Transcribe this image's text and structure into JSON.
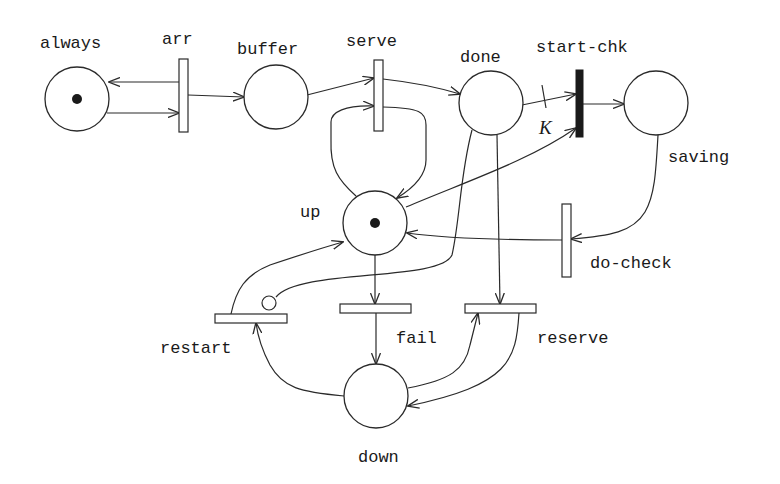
{
  "diagram": {
    "type": "petri-net",
    "places": [
      {
        "id": "always",
        "label": "always",
        "cx": 77,
        "cy": 99,
        "r": 32,
        "tokens": 1,
        "label_x": 40,
        "label_y": 48
      },
      {
        "id": "buffer",
        "label": "buffer",
        "cx": 276,
        "cy": 97,
        "r": 32,
        "tokens": 0,
        "label_x": 237,
        "label_y": 54
      },
      {
        "id": "done",
        "label": "done",
        "cx": 491,
        "cy": 103,
        "r": 32,
        "tokens": 0,
        "label_x": 460,
        "label_y": 62
      },
      {
        "id": "saving",
        "label": "saving",
        "cx": 656,
        "cy": 103,
        "r": 32,
        "tokens": 0,
        "label_x": 668,
        "label_y": 162
      },
      {
        "id": "up",
        "label": "up",
        "cx": 375,
        "cy": 223,
        "r": 32,
        "tokens": 1,
        "label_x": 300,
        "label_y": 217
      },
      {
        "id": "down",
        "label": "down",
        "cx": 376,
        "cy": 396,
        "r": 32,
        "tokens": 0,
        "label_x": 358,
        "label_y": 462
      }
    ],
    "transitions": [
      {
        "id": "arr",
        "label": "arr",
        "kind": "timed",
        "x": 179,
        "y": 59,
        "w": 9,
        "h": 73,
        "label_x": 162,
        "label_y": 44
      },
      {
        "id": "serve",
        "label": "serve",
        "kind": "timed",
        "x": 374,
        "y": 60,
        "w": 9,
        "h": 71,
        "label_x": 346,
        "label_y": 46
      },
      {
        "id": "start-chk",
        "label": "start-chk",
        "kind": "immediate",
        "x": 576,
        "y": 70,
        "w": 7,
        "h": 67,
        "label_x": 536,
        "label_y": 52
      },
      {
        "id": "do-check",
        "label": "do-check",
        "kind": "timed",
        "x": 562,
        "y": 204,
        "w": 9,
        "h": 73,
        "label_x": 590,
        "label_y": 268
      },
      {
        "id": "restart",
        "label": "restart",
        "kind": "timed",
        "x": 215,
        "y": 314,
        "w": 72,
        "h": 9,
        "label_x": 160,
        "label_y": 353
      },
      {
        "id": "fail",
        "label": "fail",
        "kind": "timed",
        "x": 340,
        "y": 304,
        "w": 71,
        "h": 9,
        "label_x": 396,
        "label_y": 343
      },
      {
        "id": "reserve",
        "label": "reserve",
        "kind": "timed",
        "x": 465,
        "y": 304,
        "w": 71,
        "h": 9,
        "label_x": 537,
        "label_y": 343
      }
    ],
    "arcs": [
      {
        "from": "arr",
        "to": "always",
        "d": "M179,82 L109,82",
        "arrow": "end"
      },
      {
        "from": "always",
        "to": "arr",
        "d": "M107,113 L179,113",
        "arrow": "end"
      },
      {
        "from": "arr",
        "to": "buffer",
        "d": "M188,95 L244,97",
        "arrow": "end"
      },
      {
        "from": "buffer",
        "to": "serve",
        "d": "M307,95 L374,78",
        "arrow": "end"
      },
      {
        "from": "serve",
        "to": "done",
        "d": "M383,79 C410,82 440,88 460,94",
        "arrow": "end"
      },
      {
        "from": "up",
        "to": "serve",
        "d": "M356,196 C338,180 330,168 331,140 L331,122 C331,112 345,105 374,106",
        "arrow": "end"
      },
      {
        "from": "serve",
        "to": "up",
        "d": "M383,107 C420,108 426,112 426,125 L426,160 C426,175 415,187 397,198",
        "arrow": "end"
      },
      {
        "from": "done",
        "to": "start-chk",
        "d": "M522,105 L576,94",
        "arrow": "end",
        "multiplicity": "K",
        "k_x": 539,
        "k_y": 134,
        "tick": "M542,85 L546,108"
      },
      {
        "from": "done",
        "to": "reserve",
        "d": "M497,135 L500,304",
        "arrow": "end"
      },
      {
        "from": "start-chk",
        "to": "saving",
        "d": "M583,104 L624,104",
        "arrow": "end"
      },
      {
        "from": "up",
        "to": "start-chk",
        "d": "M406,207 C470,180 530,160 576,128",
        "arrow": "end"
      },
      {
        "from": "saving",
        "to": "do-check",
        "d": "M658,135 C656,170 655,195 645,212 C633,232 610,236 571,239",
        "arrow": "end"
      },
      {
        "from": "do-check",
        "to": "up",
        "d": "M562,240 C500,240 450,239 407,233",
        "arrow": "end"
      },
      {
        "from": "up",
        "to": "fail",
        "d": "M375,255 L375,304",
        "arrow": "end"
      },
      {
        "from": "fail",
        "to": "down",
        "d": "M376,313 L376,364",
        "arrow": "end"
      },
      {
        "from": "restart",
        "to": "up",
        "d": "M231,314 C236,290 245,275 270,265 C300,255 325,247 343,242",
        "arrow": "end"
      },
      {
        "from": "down",
        "to": "restart",
        "d": "M344,396 C300,392 283,388 270,365 C262,350 258,338 256,323",
        "arrow": "end"
      },
      {
        "from": "down",
        "to": "reserve",
        "d": "M408,388 C450,380 465,370 470,345 L478,313",
        "arrow": "end"
      },
      {
        "from": "reserve",
        "to": "down",
        "d": "M519,313 C516,360 510,385 408,406",
        "arrow": "end"
      },
      {
        "from": "done",
        "to": "restart",
        "d": "M472,130 C460,175 460,220 452,255 C440,282 300,268 276,297",
        "arrow": "none",
        "inhibitor": true,
        "inhib_cx": 269,
        "inhib_cy": 303,
        "inhib_r": 7
      }
    ],
    "colors": {
      "stroke": "#2a2a2a",
      "token": "#1a1a1a",
      "immediate_transition": "#1a1a1a",
      "background": "#ffffff"
    }
  }
}
